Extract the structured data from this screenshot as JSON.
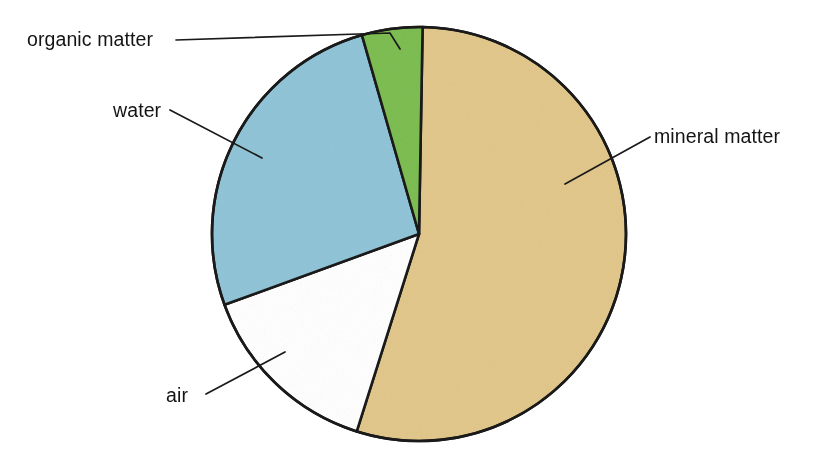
{
  "figure": {
    "background_color": "#ffffff",
    "outline_color": "#1a1a1a"
  },
  "chart_data": {
    "type": "pie",
    "title": "",
    "subtitle": "",
    "xlabel": "",
    "ylabel": "",
    "legend_position": "none",
    "grid": false,
    "labels_mode": "leader-line callouts outside the pie",
    "categories": [
      "mineral matter",
      "air",
      "water",
      "organic matter"
    ],
    "values": [
      45,
      25,
      23,
      7
    ],
    "units": "percent of soil volume",
    "slices": [
      {
        "name": "mineral-matter",
        "label": "mineral matter",
        "value": 45,
        "color": "#e3c88c",
        "start_angle_deg": 1,
        "end_angle_deg": 197.5,
        "label_position": "right"
      },
      {
        "name": "air",
        "label": "air",
        "value": 25,
        "color": "#ffffff",
        "start_angle_deg": 197.5,
        "end_angle_deg": 250,
        "label_position": "bottom-left"
      },
      {
        "name": "water",
        "label": "water",
        "value": 23,
        "color": "#92c5d9",
        "start_angle_deg": 250,
        "end_angle_deg": 344,
        "label_position": "upper-left"
      },
      {
        "name": "organic-matter",
        "label": "organic matter",
        "value": 7,
        "color": "#7dbe52",
        "start_angle_deg": 344,
        "end_angle_deg": 361,
        "label_position": "top-left"
      }
    ],
    "geometry": {
      "center_x": 419,
      "center_y": 234,
      "radius": 207
    }
  },
  "labels": {
    "organic_matter": "organic matter",
    "water": "water",
    "air": "air",
    "mineral_matter": "mineral matter"
  },
  "colors": {
    "mineral_matter": "#e3c88c",
    "air": "#ffffff",
    "water": "#92c5d9",
    "organic_matter": "#7dbe52",
    "outline": "#1a1a1a",
    "text": "#141414"
  }
}
